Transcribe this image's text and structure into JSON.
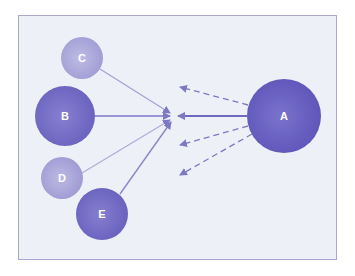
{
  "diagram": {
    "type": "influence-network",
    "colors": {
      "frame_border": "#a9a6cf",
      "background": "#eef0f7",
      "node": "#6a62c0",
      "arrow": "#7d78c4"
    },
    "hub": {
      "x": 173,
      "y": 116
    },
    "nodes": [
      {
        "id": "A",
        "label": "A",
        "cx": 284,
        "cy": 116,
        "r": 37,
        "shade": "#6259bd"
      },
      {
        "id": "B",
        "label": "B",
        "cx": 65,
        "cy": 116,
        "r": 30,
        "shade": "#716ac3"
      },
      {
        "id": "C",
        "label": "C",
        "cx": 82,
        "cy": 58,
        "r": 21,
        "shade": "#a9a5d8"
      },
      {
        "id": "D",
        "label": "D",
        "cx": 62,
        "cy": 178,
        "r": 21,
        "shade": "#a5a1d6"
      },
      {
        "id": "E",
        "label": "E",
        "cx": 102,
        "cy": 214,
        "r": 26,
        "shade": "#6f68c2"
      }
    ],
    "edges": [
      {
        "from": "C",
        "to": "hub",
        "style": "solid"
      },
      {
        "from": "B",
        "to": "hub",
        "style": "solid"
      },
      {
        "from": "D",
        "to": "hub",
        "style": "solid"
      },
      {
        "from": "E",
        "to": "hub",
        "style": "solid"
      },
      {
        "from": "A",
        "to": "hub",
        "style": "solid"
      },
      {
        "from": "A",
        "to": "out-1",
        "style": "dashed"
      },
      {
        "from": "A",
        "to": "out-2",
        "style": "dashed"
      },
      {
        "from": "A",
        "to": "out-3",
        "style": "dashed"
      }
    ]
  }
}
